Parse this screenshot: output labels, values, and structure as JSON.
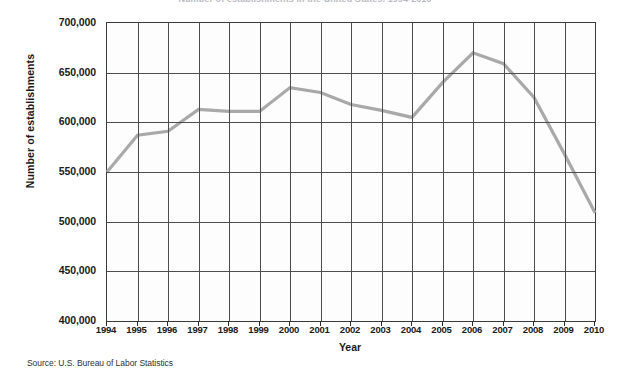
{
  "chart_data": {
    "type": "line",
    "title": "Number of establishments in the United States, 1994-2010",
    "xlabel": "Year",
    "ylabel": "Number of establishments",
    "categories": [
      1994,
      1995,
      1996,
      1997,
      1998,
      1999,
      2000,
      2001,
      2002,
      2003,
      2004,
      2005,
      2006,
      2007,
      2008,
      2009,
      2010
    ],
    "x_tick_labels": [
      "1994",
      "1995",
      "1996",
      "1997",
      "1998",
      "1999",
      "2000",
      "2001",
      "2002",
      "2003",
      "2004",
      "2005",
      "2006",
      "2007",
      "2008",
      "2009",
      "2010"
    ],
    "values": [
      550000,
      587000,
      591000,
      613000,
      611000,
      611000,
      635000,
      630000,
      618000,
      612000,
      605000,
      640000,
      670000,
      659000,
      625000,
      568000,
      509000
    ],
    "y_tick_labels": [
      "700,000",
      "650,000",
      "600,000",
      "550,000",
      "500,000",
      "450,000",
      "400,000"
    ],
    "y_tick_values": [
      700000,
      650000,
      600000,
      550000,
      500000,
      450000,
      400000
    ],
    "ylim": [
      400000,
      700000
    ],
    "xlim": [
      1994,
      2010
    ],
    "grid": "both",
    "legend": "none",
    "series_color": "#a9a9a9",
    "axis_color": "#4d4d4d"
  },
  "source": {
    "note": "Source: U.S. Bureau of Labor Statistics"
  }
}
